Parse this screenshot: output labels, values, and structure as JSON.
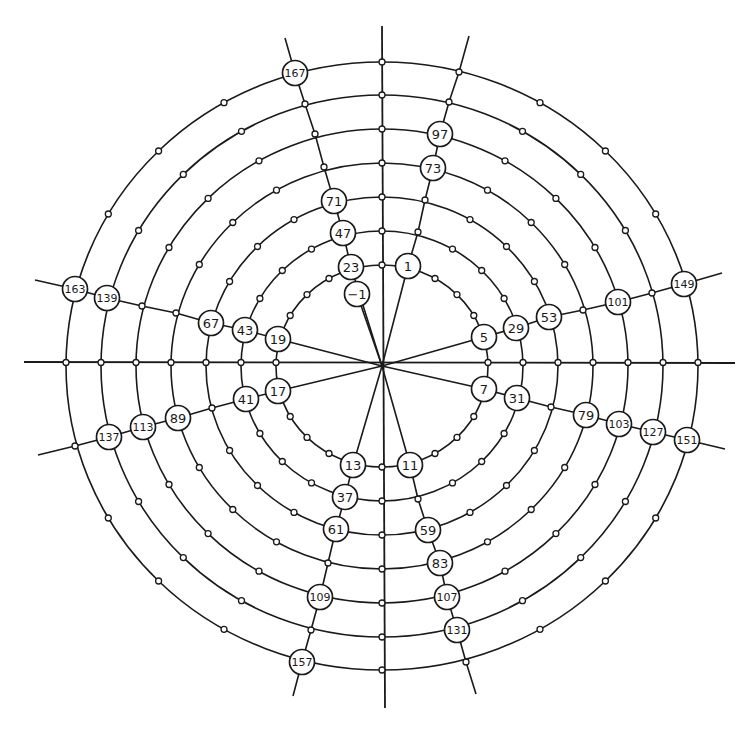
{
  "diagram": {
    "type": "polar-grid-numbered-points",
    "center": [
      382,
      366
    ],
    "rings": {
      "count": 7,
      "rx": [
        106,
        141,
        176,
        211,
        246,
        281,
        316
      ],
      "ry": [
        101,
        135,
        169,
        203,
        237,
        271,
        304
      ]
    },
    "node_step_deg": 15,
    "axes": {
      "horizontal": [
        24,
        735
      ],
      "vertical": [
        26,
        708
      ]
    },
    "spokes": [
      {
        "name": "spoke-upper-right",
        "points": [
          [
            382,
            366
          ],
          [
            408,
            266
          ],
          [
            418,
            232
          ],
          [
            425,
            200
          ],
          [
            433,
            168
          ],
          [
            440,
            134
          ],
          [
            449,
            102
          ],
          [
            459,
            72
          ],
          [
            469,
            36
          ]
        ]
      },
      {
        "name": "spoke-upper-left",
        "points": [
          [
            382,
            366
          ],
          [
            351,
            267
          ],
          [
            343,
            233
          ],
          [
            334,
            201
          ],
          [
            324,
            167
          ],
          [
            315,
            134
          ],
          [
            305,
            104
          ],
          [
            295,
            73
          ],
          [
            285,
            38
          ]
        ]
      },
      {
        "name": "spoke-minus-one",
        "points": [
          [
            382,
            366
          ],
          [
            357,
            294
          ]
        ]
      },
      {
        "name": "spoke-left-upper",
        "points": [
          [
            382,
            366
          ],
          [
            278,
            339
          ],
          [
            245,
            330
          ],
          [
            211,
            323
          ],
          [
            176,
            313
          ],
          [
            142,
            306
          ],
          [
            107,
            298
          ],
          [
            75,
            289
          ],
          [
            35,
            280
          ]
        ]
      },
      {
        "name": "spoke-left-lower",
        "points": [
          [
            382,
            366
          ],
          [
            278,
            391
          ],
          [
            246,
            399
          ],
          [
            212,
            408
          ],
          [
            178,
            418
          ],
          [
            143,
            427
          ],
          [
            109,
            437
          ],
          [
            75,
            446
          ],
          [
            38,
            455
          ]
        ]
      },
      {
        "name": "spoke-right-upper",
        "points": [
          [
            382,
            366
          ],
          [
            484,
            337
          ],
          [
            516,
            328
          ],
          [
            549,
            317
          ],
          [
            583,
            310
          ],
          [
            618,
            302
          ],
          [
            652,
            293
          ],
          [
            684,
            284
          ],
          [
            722,
            273
          ]
        ]
      },
      {
        "name": "spoke-right-lower",
        "points": [
          [
            382,
            366
          ],
          [
            484,
            389
          ],
          [
            517,
            398
          ],
          [
            551,
            407
          ],
          [
            586,
            415
          ],
          [
            619,
            424
          ],
          [
            653,
            432
          ],
          [
            687,
            440
          ],
          [
            725,
            449
          ]
        ]
      },
      {
        "name": "spoke-lower-left",
        "points": [
          [
            382,
            366
          ],
          [
            353,
            465
          ],
          [
            345,
            497
          ],
          [
            336,
            529
          ],
          [
            328,
            563
          ],
          [
            320,
            597
          ],
          [
            311,
            630
          ],
          [
            302,
            662
          ],
          [
            293,
            696
          ]
        ]
      },
      {
        "name": "spoke-lower-right",
        "points": [
          [
            382,
            366
          ],
          [
            410,
            465
          ],
          [
            418,
            499
          ],
          [
            428,
            530
          ],
          [
            440,
            563
          ],
          [
            447,
            597
          ],
          [
            457,
            630
          ],
          [
            466,
            662
          ],
          [
            476,
            694
          ]
        ]
      }
    ],
    "spoke_nodes": [
      [
        418,
        232
      ],
      [
        425,
        200
      ],
      [
        449,
        102
      ],
      [
        459,
        72
      ],
      [
        324,
        167
      ],
      [
        315,
        134
      ],
      [
        305,
        104
      ],
      [
        176,
        313
      ],
      [
        142,
        306
      ],
      [
        212,
        408
      ],
      [
        75,
        446
      ],
      [
        583,
        310
      ],
      [
        652,
        293
      ],
      [
        551,
        407
      ],
      [
        328,
        563
      ],
      [
        311,
        630
      ],
      [
        418,
        499
      ],
      [
        466,
        662
      ]
    ],
    "labels": [
      {
        "text": "167",
        "x": 295,
        "y": 73
      },
      {
        "text": "97",
        "x": 440,
        "y": 134
      },
      {
        "text": "73",
        "x": 433,
        "y": 168
      },
      {
        "text": "71",
        "x": 334,
        "y": 201
      },
      {
        "text": "47",
        "x": 343,
        "y": 233
      },
      {
        "text": "23",
        "x": 351,
        "y": 267
      },
      {
        "text": "1",
        "x": 408,
        "y": 266
      },
      {
        "text": "−1",
        "x": 357,
        "y": 294
      },
      {
        "text": "163",
        "x": 75,
        "y": 289
      },
      {
        "text": "139",
        "x": 107,
        "y": 298
      },
      {
        "text": "67",
        "x": 211,
        "y": 323
      },
      {
        "text": "43",
        "x": 245,
        "y": 330
      },
      {
        "text": "19",
        "x": 278,
        "y": 339
      },
      {
        "text": "5",
        "x": 484,
        "y": 337
      },
      {
        "text": "29",
        "x": 516,
        "y": 328
      },
      {
        "text": "53",
        "x": 549,
        "y": 317
      },
      {
        "text": "101",
        "x": 618,
        "y": 302
      },
      {
        "text": "149",
        "x": 684,
        "y": 284
      },
      {
        "text": "17",
        "x": 278,
        "y": 391
      },
      {
        "text": "41",
        "x": 246,
        "y": 399
      },
      {
        "text": "89",
        "x": 178,
        "y": 418
      },
      {
        "text": "113",
        "x": 143,
        "y": 427
      },
      {
        "text": "137",
        "x": 109,
        "y": 437
      },
      {
        "text": "7",
        "x": 484,
        "y": 389
      },
      {
        "text": "31",
        "x": 517,
        "y": 398
      },
      {
        "text": "79",
        "x": 586,
        "y": 415
      },
      {
        "text": "103",
        "x": 619,
        "y": 424
      },
      {
        "text": "127",
        "x": 653,
        "y": 432
      },
      {
        "text": "151",
        "x": 687,
        "y": 440
      },
      {
        "text": "13",
        "x": 353,
        "y": 465
      },
      {
        "text": "11",
        "x": 410,
        "y": 465
      },
      {
        "text": "37",
        "x": 345,
        "y": 497
      },
      {
        "text": "61",
        "x": 336,
        "y": 529
      },
      {
        "text": "59",
        "x": 428,
        "y": 530
      },
      {
        "text": "83",
        "x": 440,
        "y": 563
      },
      {
        "text": "109",
        "x": 320,
        "y": 597
      },
      {
        "text": "107",
        "x": 447,
        "y": 597
      },
      {
        "text": "131",
        "x": 457,
        "y": 630
      },
      {
        "text": "157",
        "x": 302,
        "y": 662
      }
    ],
    "colors": {
      "line": "#1a1a1a",
      "background": "#ffffff"
    }
  }
}
